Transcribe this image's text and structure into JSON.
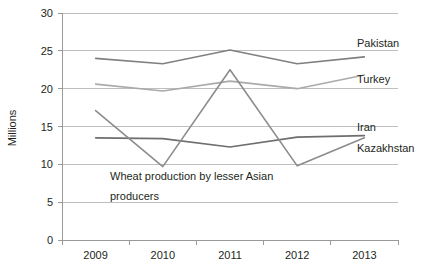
{
  "chart_data": {
    "type": "line",
    "title": "",
    "annotation": {
      "line1": "Wheat production by lesser Asian",
      "line2": "producers"
    },
    "xlabel": "",
    "ylabel": "Millions",
    "categories": [
      "2009",
      "2010",
      "2011",
      "2012",
      "2013"
    ],
    "ylim": [
      0,
      30
    ],
    "yticks": [
      "0",
      "5",
      "10",
      "15",
      "20",
      "25",
      "30"
    ],
    "grid": true,
    "legend_position": "right-inline",
    "series": [
      {
        "name": "Pakistan",
        "color": "#808080",
        "values": [
          24.0,
          23.3,
          25.1,
          23.3,
          24.2
        ]
      },
      {
        "name": "Turkey",
        "color": "#aaaaaa",
        "values": [
          20.6,
          19.7,
          21.0,
          20.0,
          21.8
        ]
      },
      {
        "name": "Iran",
        "color": "#6e6e6e",
        "values": [
          13.5,
          13.4,
          12.3,
          13.6,
          13.8
        ]
      },
      {
        "name": "Kazakhstan",
        "color": "#8c8c8c",
        "values": [
          17.1,
          9.7,
          22.5,
          9.8,
          13.5
        ]
      }
    ]
  }
}
